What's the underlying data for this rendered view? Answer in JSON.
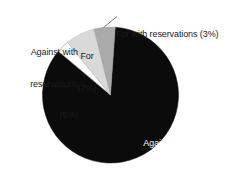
{
  "chart_data": {
    "type": "pie",
    "title": "",
    "subtitle": "",
    "xlabel": "",
    "ylabel": "",
    "grid": false,
    "legend": "none",
    "label_style": "category name with percent in parentheses",
    "start_angle_deg": 4,
    "direction": "clockwise",
    "categories": [
      "Against",
      "For",
      "Against with reservations",
      "For with reservations"
    ],
    "values": [
      85,
      7,
      5,
      3
    ],
    "units": "percent",
    "total": 100,
    "slices": [
      {
        "name": "Against",
        "value": 85,
        "percent_text": "(85%)",
        "color": "#0b0b0b",
        "label_placement": "inside",
        "label_color": "#ffffff"
      },
      {
        "name": "For",
        "value": 7,
        "percent_text": "(7%)",
        "color": "#d9d9d9",
        "label_placement": "outside-over-slice",
        "label_color": "#1a1a1a"
      },
      {
        "name": "Against with reservations",
        "value": 5,
        "percent_text": "(5%)",
        "color": "#aaaaaa",
        "label_placement": "outside-left",
        "label_color": "#1a1a1a"
      },
      {
        "name": "For with reservations",
        "value": 3,
        "percent_text": "(3%)",
        "color": "#ffffff",
        "label_placement": "outside-top-with-leader",
        "label_color": "#1a1a1a"
      }
    ]
  },
  "labels": {
    "against": {
      "line1": "Against",
      "line2": "(85%)"
    },
    "for": {
      "line1": "For",
      "line2": "(7%)"
    },
    "against_with_reservations": {
      "line1": "Against with",
      "line2": "reservations",
      "line3": "(5%)"
    },
    "for_with_reservations": {
      "line1": "For with reservations (3%)"
    }
  },
  "colors": {
    "background": "#ffffff",
    "slice_against": "#0b0b0b",
    "slice_for": "#d9d9d9",
    "slice_against_with_reservations": "#aaaaaa",
    "slice_for_with_reservations": "#ffffff",
    "outline": "#8c8c8c",
    "text_dark": "#1a1a1a",
    "text_light": "#ffffff"
  }
}
